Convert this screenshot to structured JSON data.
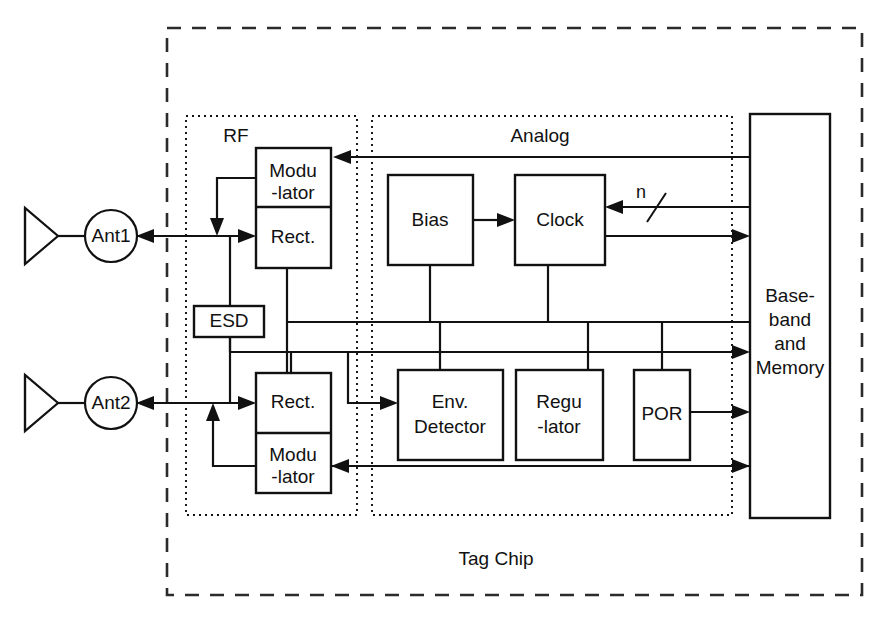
{
  "diagram": {
    "chip_label": "Tag Chip",
    "groups": [
      {
        "id": "rf",
        "label": "RF"
      },
      {
        "id": "analog",
        "label": "Analog"
      }
    ],
    "antennas": [
      {
        "id": "ant1",
        "label": "Ant1"
      },
      {
        "id": "ant2",
        "label": "Ant2"
      }
    ],
    "blocks": {
      "rf_top": {
        "upper_line1": "Modu",
        "upper_line2": "-lator",
        "lower_line1": "Rect."
      },
      "rf_bottom": {
        "upper_line1": "Rect.",
        "lower_line1": "Modu",
        "lower_line2": "-lator"
      },
      "esd": {
        "label": "ESD"
      },
      "bias": {
        "label": "Bias"
      },
      "clock": {
        "label": "Clock"
      },
      "env_detector": {
        "line1": "Env.",
        "line2": "Detector"
      },
      "regulator": {
        "line1": "Regu",
        "line2": "-lator"
      },
      "por": {
        "label": "POR"
      },
      "baseband": {
        "line1": "Base-",
        "line2": "band",
        "line3": "and",
        "line4": "Memory"
      }
    },
    "bus_label": "n",
    "colors": {
      "line": "#111111",
      "background": "#ffffff",
      "chip_border": "#2b2b2b"
    }
  }
}
